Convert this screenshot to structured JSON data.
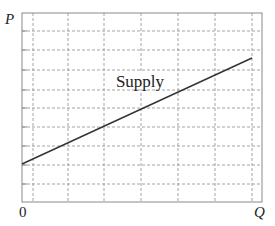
{
  "chart_data": {
    "type": "line",
    "title": "",
    "xlabel": "Q",
    "ylabel": "P",
    "origin_label": "0",
    "grid": true,
    "grid_style": "dashed",
    "legend": "none",
    "x_ticks_labeled": false,
    "y_ticks_labeled": false,
    "xlim": [
      0,
      6.5
    ],
    "ylim": [
      0,
      10
    ],
    "series": [
      {
        "name": "Supply",
        "label": "Supply",
        "label_position": {
          "x": 3.2,
          "y": 6.0
        },
        "points": [
          {
            "x": 0,
            "y": 2.0
          },
          {
            "x": 6.2,
            "y": 7.6
          }
        ],
        "slope": "positive",
        "color": "#333333"
      }
    ],
    "annotations": [
      {
        "text": "Supply",
        "anchor": "upper-middle of line"
      }
    ]
  },
  "labels": {
    "y_axis": "P",
    "x_axis": "Q",
    "origin": "0",
    "series_label": "Supply"
  },
  "colors": {
    "frame": "#8a8a8a",
    "grid": "#9a9a9a",
    "line": "#333333",
    "text": "#222222",
    "background": "#ffffff"
  }
}
